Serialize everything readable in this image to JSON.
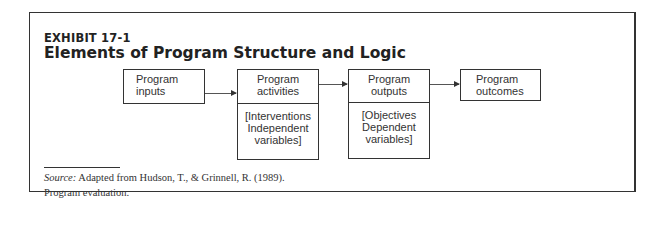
{
  "exhibit": {
    "label": "EXHIBIT 17-1",
    "title": "Elements of Program Structure and Logic"
  },
  "diagram": {
    "boxes": [
      {
        "id": "inputs",
        "line1": "Program",
        "line2": "inputs"
      },
      {
        "id": "activities",
        "line1": "Program",
        "line2": "activities",
        "detail": [
          "[Interventions",
          "Independent",
          "variables]"
        ]
      },
      {
        "id": "outputs",
        "line1": "Program",
        "line2": "outputs",
        "detail": [
          "[Objectives",
          "Dependent",
          "variables]"
        ]
      },
      {
        "id": "outcomes",
        "line1": "Program",
        "line2": "outcomes"
      }
    ]
  },
  "source": {
    "prefix": "Source:",
    "line1": "Adapted from Hudson, T., & Grinnell, R. (1989).",
    "line2": "Program evaluation."
  }
}
